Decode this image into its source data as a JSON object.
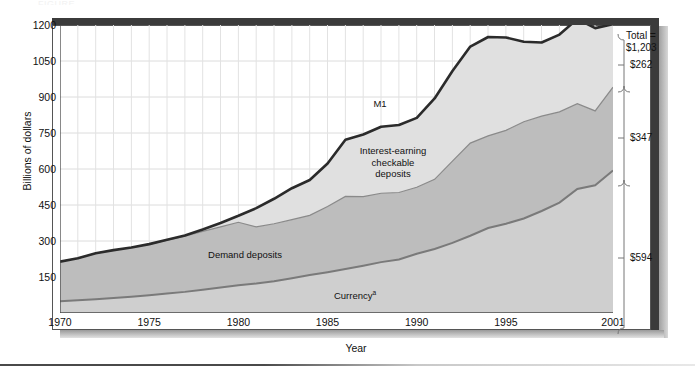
{
  "caption_remnant": "FIGURE",
  "axes": {
    "y_title": "Billions of dollars",
    "x_title": "Year",
    "y_ticks": [
      "150",
      "300",
      "450",
      "600",
      "750",
      "900",
      "1050",
      "1200"
    ],
    "x_ticks": [
      "1970",
      "1975",
      "1980",
      "1985",
      "1990",
      "1995",
      "2001"
    ]
  },
  "series_labels": {
    "m1": "M1",
    "interest_earning": "Interest-earning\ncheckable\ndeposits",
    "demand_deposits": "Demand deposits",
    "currency": "Currency",
    "currency_footnote": "a"
  },
  "breakdown": {
    "total_label": "Total =\n$1,203",
    "items": [
      {
        "name": "interest-earning-checkable-deposits",
        "amount": "$262"
      },
      {
        "name": "demand-deposits",
        "amount": "$347"
      },
      {
        "name": "currency",
        "amount": "$594"
      }
    ]
  },
  "colors": {
    "m1_line": "#2b2b2b",
    "interest_earning_fill": "#e0e0e0",
    "demand_deposits_fill": "#bdbdbd",
    "currency_fill": "#cfcfcf",
    "currency_line": "#7a7a7a",
    "demand_line": "#8a8a8a",
    "gridline": "#dcdcdc",
    "frame": "#3b3b3b"
  },
  "chart_data": {
    "type": "area",
    "title": "",
    "subtitle": "",
    "xlabel": "Year",
    "ylabel": "Billions of dollars",
    "xlim": [
      1970,
      2001
    ],
    "ylim": [
      0,
      1200
    ],
    "grid": true,
    "legend": "in-plot annotations",
    "stacked": true,
    "x": [
      1970,
      1971,
      1972,
      1973,
      1974,
      1975,
      1976,
      1977,
      1978,
      1979,
      1980,
      1981,
      1982,
      1983,
      1984,
      1985,
      1986,
      1987,
      1988,
      1989,
      1990,
      1991,
      1992,
      1993,
      1994,
      1995,
      1996,
      1997,
      1998,
      1999,
      2000,
      2001
    ],
    "series": [
      {
        "name": "Currency",
        "values": [
          49,
          53,
          57,
          62,
          68,
          74,
          81,
          88,
          97,
          106,
          116,
          123,
          132,
          145,
          158,
          170,
          183,
          197,
          212,
          223,
          247,
          267,
          292,
          322,
          354,
          372,
          394,
          425,
          460,
          517,
          532,
          594
        ]
      },
      {
        "name": "Demand deposits",
        "values": [
          165,
          175,
          192,
          200,
          205,
          212,
          222,
          232,
          243,
          253,
          262,
          236,
          240,
          244,
          249,
          274,
          303,
          288,
          287,
          279,
          277,
          290,
          341,
          386,
          384,
          389,
          403,
          395,
          378,
          355,
          310,
          347
        ]
      },
      {
        "name": "Interest-earning checkable deposits",
        "values": [
          0,
          0,
          0,
          0,
          0,
          1,
          2,
          3,
          8,
          16,
          27,
          78,
          104,
          131,
          147,
          179,
          236,
          259,
          277,
          281,
          289,
          337,
          375,
          402,
          412,
          387,
          333,
          307,
          322,
          353,
          345,
          262
        ]
      }
    ],
    "totals_label": "M1",
    "totals": [
      214,
      228,
      249,
      262,
      273,
      287,
      305,
      323,
      348,
      375,
      405,
      437,
      476,
      520,
      554,
      623,
      722,
      744,
      776,
      783,
      813,
      894,
      1008,
      1110,
      1150,
      1148,
      1130,
      1127,
      1160,
      1225,
      1187,
      1203
    ],
    "annotations": [
      {
        "text": "M1",
        "role": "total-boundary-label"
      },
      {
        "text": "Interest-earning checkable deposits",
        "role": "band-label"
      },
      {
        "text": "Demand deposits",
        "role": "band-label"
      },
      {
        "text": "Currency",
        "role": "band-label"
      }
    ],
    "end_year_breakdown": {
      "year": 2001,
      "total": 1203,
      "currency": 594,
      "demand_deposits": 347,
      "interest_earning_checkable_deposits": 262
    }
  }
}
